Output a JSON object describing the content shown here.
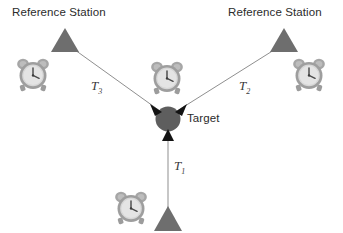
{
  "diagram": {
    "type": "time-of-arrival-positioning-diagram",
    "background_color": "#ffffff",
    "width": 343,
    "height": 233,
    "colors": {
      "triangle_fill": "#6e6e6e",
      "target_fill": "#5e5e5e",
      "line_stroke": "#8a8a8a",
      "arrowhead_fill": "#111111",
      "clock_body": "#a8a8a8",
      "clock_face": "#d9d9d9",
      "text": "#2b2b2b"
    },
    "labels": {
      "reference_station_left": "Reference Station",
      "reference_station_right": "Reference Station",
      "target": "Target"
    },
    "measurements": [
      {
        "id": "T3",
        "symbol": "T",
        "subscript": "3",
        "from": "reference-station-left",
        "to": "target"
      },
      {
        "id": "T2",
        "symbol": "T",
        "subscript": "2",
        "from": "reference-station-right",
        "to": "target"
      },
      {
        "id": "T1",
        "symbol": "T",
        "subscript": "1",
        "from": "reference-station-bottom",
        "to": "target"
      }
    ],
    "stations": [
      {
        "id": "left",
        "label": "Reference Station",
        "has_clock": true
      },
      {
        "id": "right",
        "label": "Reference Station",
        "has_clock": true
      },
      {
        "id": "bottom",
        "label": "",
        "has_clock": true
      }
    ],
    "target_node": {
      "label": "Target",
      "has_clock": true
    }
  }
}
